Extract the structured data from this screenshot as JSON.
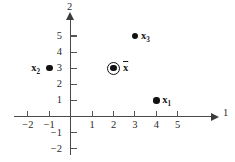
{
  "chart_data": {
    "type": "scatter",
    "title": "",
    "xlabel": "1",
    "ylabel": "2",
    "xlim": [
      -2.7,
      6.6
    ],
    "ylim": [
      -2.6,
      6.2
    ],
    "grid": false,
    "legend": "none",
    "x_ticks": [
      {
        "value": -2,
        "label": "−2"
      },
      {
        "value": -1,
        "label": "−1"
      },
      {
        "value": 1,
        "label": "1"
      },
      {
        "value": 2,
        "label": "2"
      },
      {
        "value": 3,
        "label": "3"
      },
      {
        "value": 4,
        "label": "4"
      },
      {
        "value": 5,
        "label": "5"
      }
    ],
    "y_ticks": [
      {
        "value": 5,
        "label": "5"
      },
      {
        "value": 4,
        "label": "4"
      },
      {
        "value": 3,
        "label": "3"
      },
      {
        "value": 2,
        "label": "2"
      },
      {
        "value": 1,
        "label": "1"
      },
      {
        "value": -1,
        "label": "−1"
      },
      {
        "value": -2,
        "label": "−2"
      }
    ],
    "points": [
      {
        "name": "x1",
        "label_main": "x",
        "label_sub": "1",
        "x": 4,
        "y": 1,
        "label_side": "right"
      },
      {
        "name": "x2",
        "label_main": "x",
        "label_sub": "2",
        "x": -1,
        "y": 3,
        "label_side": "left"
      },
      {
        "name": "x3",
        "label_main": "x",
        "label_sub": "3",
        "x": 3,
        "y": 5,
        "label_side": "right"
      }
    ],
    "mean_point": {
      "name": "x-bar",
      "label_main": "x",
      "x": 2,
      "y": 3,
      "marker": "circled-dot",
      "label_side": "right"
    },
    "colors": {
      "axis": "#4a4a4a",
      "tick": "#555555",
      "point": "#111111",
      "text": "#1a1a1a",
      "background": "#ffffff"
    }
  }
}
